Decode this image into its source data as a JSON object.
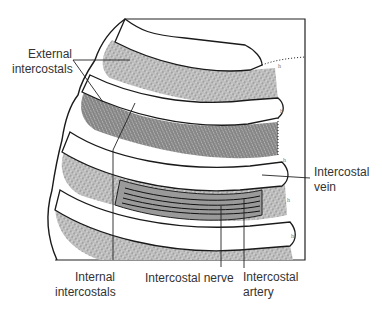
{
  "figure": {
    "colors": {
      "outline": "#1a1a1a",
      "muscle_fill": "#c4c4c4",
      "muscle_dark": "#9a9a9a",
      "rib": "#ffffff",
      "text": "#333333"
    }
  },
  "labels": {
    "external_intercostals": {
      "line1": "External",
      "line2": "intercostals"
    },
    "internal_intercostals": {
      "line1": "Internal",
      "line2": "intercostals"
    },
    "intercostal_nerve": {
      "line1": "Intercostal nerve"
    },
    "intercostal_artery": {
      "line1": "Intercostal",
      "line2": "artery"
    },
    "intercostal_vein": {
      "line1": "Intercostal",
      "line2": "vein"
    }
  }
}
